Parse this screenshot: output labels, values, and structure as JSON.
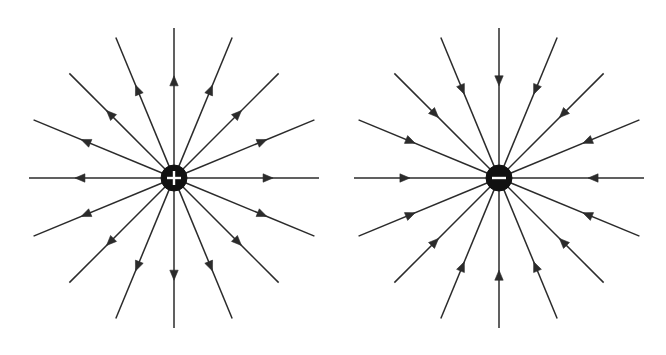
{
  "figure": {
    "background_color": "#ffffff",
    "line_color": "#2b2b2b",
    "charge_fill_color": "#111111",
    "charge_sign_color": "#ffffff",
    "width": 666,
    "height": 355
  },
  "panels": [
    {
      "id": "positive-charge-panel",
      "name": "positive-point-charge",
      "charge_sign": "+",
      "charge_polarity": "positive",
      "field_direction": "outward",
      "center_x": 174,
      "center_y": 178,
      "charge_radius": 13,
      "ray_count": 16,
      "angle_step_deg": 22.5,
      "rays": [
        {
          "angle_deg": 0,
          "length": 145,
          "arrow_at": 0.62
        },
        {
          "angle_deg": 22.5,
          "length": 152,
          "arrow_at": 0.6
        },
        {
          "angle_deg": 45,
          "length": 148,
          "arrow_at": 0.58
        },
        {
          "angle_deg": 67.5,
          "length": 152,
          "arrow_at": 0.6
        },
        {
          "angle_deg": 90,
          "length": 150,
          "arrow_at": 0.62
        },
        {
          "angle_deg": 112.5,
          "length": 152,
          "arrow_at": 0.6
        },
        {
          "angle_deg": 135,
          "length": 148,
          "arrow_at": 0.58
        },
        {
          "angle_deg": 157.5,
          "length": 152,
          "arrow_at": 0.6
        },
        {
          "angle_deg": 180,
          "length": 145,
          "arrow_at": 0.62
        },
        {
          "angle_deg": 202.5,
          "length": 152,
          "arrow_at": 0.6
        },
        {
          "angle_deg": 225,
          "length": 148,
          "arrow_at": 0.58
        },
        {
          "angle_deg": 247.5,
          "length": 152,
          "arrow_at": 0.6
        },
        {
          "angle_deg": 270,
          "length": 150,
          "arrow_at": 0.62
        },
        {
          "angle_deg": 292.5,
          "length": 152,
          "arrow_at": 0.6
        },
        {
          "angle_deg": 315,
          "length": 148,
          "arrow_at": 0.58
        },
        {
          "angle_deg": 337.5,
          "length": 152,
          "arrow_at": 0.6
        }
      ]
    },
    {
      "id": "negative-charge-panel",
      "name": "negative-point-charge",
      "charge_sign": "–",
      "charge_polarity": "negative",
      "field_direction": "inward",
      "center_x": 499,
      "center_y": 178,
      "charge_radius": 13,
      "ray_count": 16,
      "angle_step_deg": 22.5,
      "rays": [
        {
          "angle_deg": 0,
          "length": 145,
          "arrow_at": 0.62
        },
        {
          "angle_deg": 22.5,
          "length": 152,
          "arrow_at": 0.6
        },
        {
          "angle_deg": 45,
          "length": 148,
          "arrow_at": 0.58
        },
        {
          "angle_deg": 67.5,
          "length": 152,
          "arrow_at": 0.6
        },
        {
          "angle_deg": 90,
          "length": 150,
          "arrow_at": 0.62
        },
        {
          "angle_deg": 112.5,
          "length": 152,
          "arrow_at": 0.6
        },
        {
          "angle_deg": 135,
          "length": 148,
          "arrow_at": 0.58
        },
        {
          "angle_deg": 157.5,
          "length": 152,
          "arrow_at": 0.6
        },
        {
          "angle_deg": 180,
          "length": 145,
          "arrow_at": 0.62
        },
        {
          "angle_deg": 202.5,
          "length": 152,
          "arrow_at": 0.6
        },
        {
          "angle_deg": 225,
          "length": 148,
          "arrow_at": 0.58
        },
        {
          "angle_deg": 247.5,
          "length": 152,
          "arrow_at": 0.6
        },
        {
          "angle_deg": 270,
          "length": 150,
          "arrow_at": 0.62
        },
        {
          "angle_deg": 292.5,
          "length": 152,
          "arrow_at": 0.6
        },
        {
          "angle_deg": 315,
          "length": 148,
          "arrow_at": 0.58
        },
        {
          "angle_deg": 337.5,
          "length": 152,
          "arrow_at": 0.6
        }
      ]
    }
  ]
}
